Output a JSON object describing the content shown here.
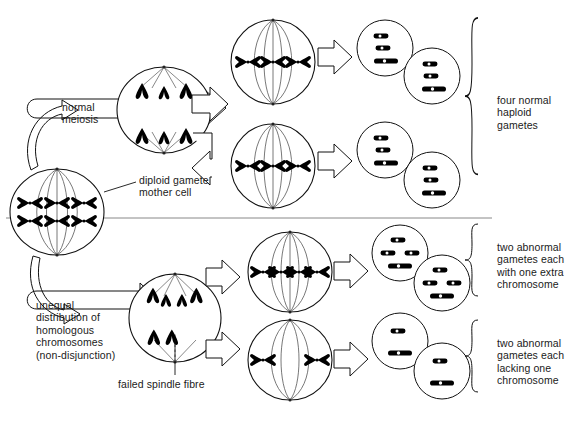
{
  "diagram": {
    "stroke_color": "#111111",
    "chromosome_color": "#000000",
    "background": "#ffffff"
  },
  "labels": {
    "normal_meiosis": "normal\nmeiosis",
    "mother_cell": "diploid gamete\nmother cell",
    "non_disjunction": "unequal\ndistribution of\nhomologous\nchromosomes\n(non-disjunction)",
    "failed_spindle": "failed spindle fibre",
    "four_normal": "four normal\nhaploid\ngametes",
    "two_extra": "two abnormal\ngametes each\nwith one extra\nchromosome",
    "two_lacking": "two abnormal\ngametes each\nlacking one\nchromosome"
  },
  "cells": {
    "mother_cell": {
      "name": "diploid gamete mother cell",
      "chromosome_pairs": 3,
      "rows": 2,
      "stage": "metaphase I"
    },
    "normal_anaphase": {
      "name": "normal anaphase",
      "top_pole_chromosomes": 3,
      "bottom_pole_chromosomes": 3
    },
    "normal_metaphase_upper": {
      "name": "normal metaphase II upper",
      "chromosomes": 3
    },
    "normal_metaphase_lower": {
      "name": "normal metaphase II lower",
      "chromosomes": 3
    },
    "nondisjunction_anaphase": {
      "name": "non-disjunction anaphase",
      "top_pole_chromosomes": 4,
      "bottom_pole_chromosomes": 2
    },
    "abnormal_metaphase_upper": {
      "name": "abnormal metaphase II upper",
      "chromosomes": 4
    },
    "abnormal_metaphase_lower": {
      "name": "abnormal metaphase II lower",
      "chromosomes": 2
    },
    "gametes_normal": {
      "count": 4,
      "chromosomes_each": 3
    },
    "gametes_extra": {
      "count": 2,
      "chromosomes_each": 4
    },
    "gametes_lacking": {
      "count": 2,
      "chromosomes_each": 2
    }
  },
  "brackets": [
    {
      "name": "four-normal-haploid-gametes"
    },
    {
      "name": "two-abnormal-extra-chromosome"
    },
    {
      "name": "two-abnormal-lacking-chromosome"
    }
  ]
}
